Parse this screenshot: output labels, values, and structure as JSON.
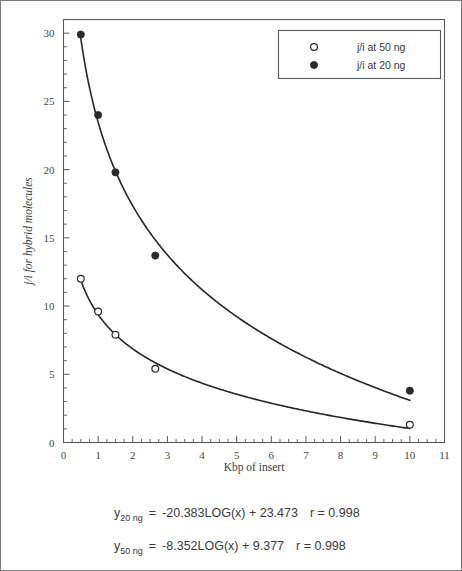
{
  "figure": {
    "border_color": "#7c7c7c",
    "background": "#ffffff"
  },
  "chart_data": {
    "type": "scatter",
    "title": "",
    "subtitle": "",
    "xlabel": "Kbp of insert",
    "ylabel": "j/i for hybrid molecules",
    "xlim": [
      0,
      11
    ],
    "ylim": [
      0,
      31
    ],
    "xticks": [
      0,
      1,
      2,
      3,
      4,
      5,
      6,
      7,
      8,
      9,
      10,
      11
    ],
    "xticklabels": [
      "0",
      "1",
      "2",
      "3",
      "4",
      "5",
      "6",
      "7",
      "8",
      "9",
      "10",
      "11"
    ],
    "yticks": [
      0,
      5,
      10,
      15,
      20,
      25,
      30
    ],
    "yticklabels": [
      "0",
      "5",
      "10",
      "15",
      "20",
      "25",
      "30"
    ],
    "x_minor_step": 0.25,
    "y_minor_step": 1,
    "grid": false,
    "legend_position": "top-right",
    "marker_color": "#2b2b2b",
    "curve_color": "#262626",
    "series": [
      {
        "name": "j/i at 50 ng",
        "marker": "open-circle",
        "x": [
          0.5,
          1.0,
          1.5,
          2.65,
          10.0
        ],
        "values": [
          12.0,
          9.6,
          7.9,
          5.4,
          1.3
        ],
        "fit": "-8.352LOG(x) + 9.377",
        "fit_slope": -8.352,
        "fit_intercept": 9.377,
        "r": "0.998"
      },
      {
        "name": "j/i at 20 ng",
        "marker": "filled-circle",
        "x": [
          0.5,
          1.0,
          1.5,
          2.65,
          10.0
        ],
        "values": [
          29.9,
          24.0,
          19.8,
          13.7,
          3.8
        ],
        "fit": "-20.383LOG(x) + 23.473",
        "fit_slope": -20.383,
        "fit_intercept": 23.473,
        "r": "0.998"
      }
    ],
    "annotations": [
      {
        "id": "eq-20ng",
        "var": "y",
        "subscript": "20 ng",
        "equals": "=",
        "expression": "-20.383LOG(x) + 23.473",
        "r_text": "r = 0.998"
      },
      {
        "id": "eq-50ng",
        "var": "y",
        "subscript": "50 ng",
        "equals": "=",
        "expression": "-8.352LOG(x) + 9.377",
        "r_text": "r = 0.998"
      }
    ]
  },
  "legend": {
    "entries": [
      {
        "label": "j/i at 50 ng",
        "marker": "open-circle"
      },
      {
        "label": "j/i at 20 ng",
        "marker": "filled-circle"
      }
    ]
  }
}
